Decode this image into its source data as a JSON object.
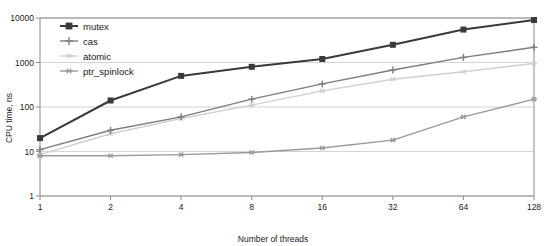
{
  "chart_data": {
    "type": "line",
    "title": "",
    "subtitle": "",
    "xlabel": "Number of threads",
    "ylabel": "CPU time, ns",
    "xscale": "log2",
    "yscale": "log10",
    "xlim": [
      1,
      128
    ],
    "ylim": [
      1,
      10000
    ],
    "grid": true,
    "legend_position": "top-left",
    "x": [
      1,
      2,
      4,
      8,
      16,
      32,
      64,
      128
    ],
    "xtick_labels": [
      "1",
      "2",
      "4",
      "8",
      "16",
      "32",
      "64",
      "128"
    ],
    "ytick_labels": [
      "1",
      "10",
      "100",
      "1000",
      "10000"
    ],
    "ytick_values": [
      1,
      10,
      100,
      1000,
      10000
    ],
    "series": [
      {
        "name": "mutex",
        "color": "#3a3a3a",
        "marker": "filled-square",
        "values": [
          20,
          140,
          500,
          800,
          1200,
          2500,
          5500,
          9000
        ]
      },
      {
        "name": "cas",
        "color": "#7d7d7d",
        "marker": "plus",
        "values": [
          11,
          30,
          60,
          150,
          330,
          680,
          1300,
          2200
        ]
      },
      {
        "name": "atomic",
        "color": "#d0d0d0",
        "marker": "star",
        "values": [
          8.5,
          25,
          55,
          110,
          230,
          420,
          620,
          950
        ]
      },
      {
        "name": "ptr_spinlock",
        "color": "#9a9a9a",
        "marker": "asterisk",
        "values": [
          8,
          8,
          8.5,
          9.5,
          12,
          18,
          60,
          150
        ]
      }
    ]
  },
  "legend": {
    "items": [
      {
        "label": "mutex"
      },
      {
        "label": "cas"
      },
      {
        "label": "atomic"
      },
      {
        "label": "ptr_spinlock"
      }
    ]
  },
  "axes": {
    "x_title": "Number of threads",
    "y_title": "CPU time, ns"
  }
}
